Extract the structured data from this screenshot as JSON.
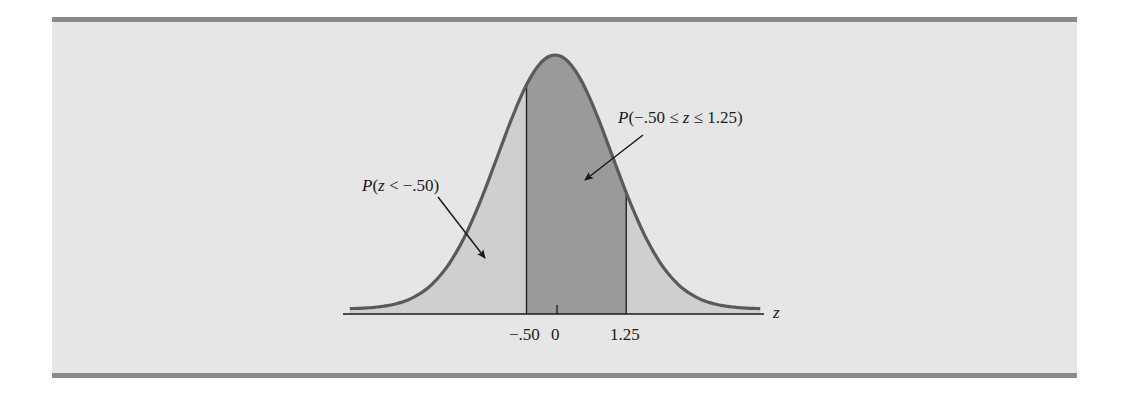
{
  "chart_data": {
    "type": "area",
    "title": "",
    "xlabel": "z",
    "ylabel": "",
    "x_ticks": [
      {
        "value": -0.5,
        "label": "-.50"
      },
      {
        "value": 0,
        "label": "0"
      },
      {
        "value": 1.25,
        "label": "1.25"
      }
    ],
    "distribution": {
      "name": "standard normal",
      "mean": 0,
      "sd": 1
    },
    "x_range": [
      -3.6,
      3.6
    ],
    "regions": [
      {
        "name": "P(z < -.50)",
        "from": -3.6,
        "to": -0.5,
        "shade": "light",
        "probability": 0.3085
      },
      {
        "name": "P(-.50 ≤ z ≤ 1.25)",
        "from": -0.5,
        "to": 1.25,
        "shade": "dark",
        "probability": 0.5859
      },
      {
        "name": "P(z > 1.25)",
        "from": 1.25,
        "to": 3.6,
        "shade": "light",
        "probability": 0.1056
      }
    ],
    "annotations": [
      {
        "text": "P(z < −.50)",
        "points_to_region": 0
      },
      {
        "text": "P(−.50 ≤ z ≤ 1.25)",
        "points_to_region": 1
      }
    ],
    "grid": false,
    "legend": "none"
  },
  "labels": {
    "axis_var": "z",
    "tick_neg050": "−.50",
    "tick_0": "0",
    "tick_125": "1.25",
    "ann_left_P": "P",
    "ann_left_rest": "(",
    "ann_left_z": "z",
    "ann_left_tail": " < −.50)",
    "ann_mid_P": "P",
    "ann_mid_a": "(−.50 ≤ ",
    "ann_mid_z": "z",
    "ann_mid_b": " ≤ 1.25)"
  },
  "colors": {
    "panel": "#e6e6e6",
    "rule": "#8a8a8a",
    "light_shade": "#cfcfcf",
    "dark_shade": "#9a9a9a",
    "curve": "#5a5a5a",
    "ink": "#1a1a1a"
  }
}
